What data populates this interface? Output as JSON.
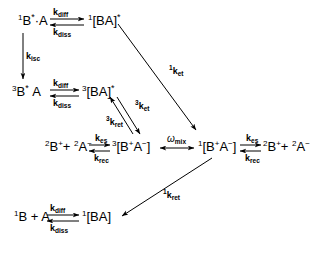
{
  "diagram": {
    "type": "reaction-scheme",
    "stroke_color": "#000000",
    "background_color": "#ffffff",
    "species": [
      {
        "id": "s1-excited-singlet-pair",
        "html": "<sup>1</sup>B<span class=\"ast\">*</span>&middot;A",
        "x": 18,
        "y": 14
      },
      {
        "id": "s1-singlet-exciplex",
        "html": "<sup>1</sup>[BA]<span class=\"ast\">*</span>",
        "x": 88,
        "y": 14
      },
      {
        "id": "t1-excited-triplet-pair",
        "html": "<sup>3</sup>B<span class=\"ast\">*</span>&nbsp;A",
        "x": 12,
        "y": 85
      },
      {
        "id": "t1-triplet-exciplex",
        "html": "<sup>3</sup>[BA]<span class=\"ast\">*</span>",
        "x": 82,
        "y": 85
      },
      {
        "id": "free-radical-ions-left",
        "html": "<sup>2</sup>B<sup>+</sup>+ <sup>2</sup>A<sup>&minus;</sup>",
        "x": 45,
        "y": 140
      },
      {
        "id": "triplet-radical-ion-pair",
        "html": "<sup>3</sup>[B<sup>+</sup>A<sup>&minus;</sup>]",
        "x": 112,
        "y": 140
      },
      {
        "id": "singlet-radical-ion-pair",
        "html": "<sup>1</sup>[B<sup>+</sup>A<sup>&minus;</sup>]",
        "x": 198,
        "y": 140
      },
      {
        "id": "free-radical-ions-right",
        "html": "<sup>2</sup>B<sup>+</sup>+ <sup>2</sup>A<sup>&minus;</sup>",
        "x": 263,
        "y": 140
      },
      {
        "id": "ground-state-pair",
        "html": "<sup>1</sup>B + A",
        "x": 14,
        "y": 210
      },
      {
        "id": "ground-state-complex",
        "html": "<sup>1</sup>[BA]",
        "x": 82,
        "y": 210
      }
    ],
    "rate_labels": [
      {
        "id": "k-diff-row1",
        "html": "k<sub>diff</sub>",
        "x": 53,
        "y": 8
      },
      {
        "id": "k-diss-row1",
        "html": "k<sub>diss</sub>",
        "x": 53,
        "y": 28
      },
      {
        "id": "k-isc",
        "html": "k<sub>isc</sub>",
        "x": 26,
        "y": 52
      },
      {
        "id": "k-diff-row2",
        "html": "k<sub>diff</sub>",
        "x": 53,
        "y": 79
      },
      {
        "id": "k-diss-row2",
        "html": "k<sub>diss</sub>",
        "x": 53,
        "y": 99
      },
      {
        "id": "k-et-singlet",
        "html": "<sup>1</sup>k<sub>et</sub>",
        "x": 169,
        "y": 67
      },
      {
        "id": "k-et-triplet",
        "html": "<sup>3</sup>k<sub>et</sub>",
        "x": 135,
        "y": 102
      },
      {
        "id": "k-ret-triplet",
        "html": "<sup>3</sup>k<sub>ret</sub>",
        "x": 106,
        "y": 118
      },
      {
        "id": "k-es-left",
        "html": "k<sub>es</sub>",
        "x": 95,
        "y": 134
      },
      {
        "id": "k-rec-left",
        "html": "k<sub>rec</sub>",
        "x": 94,
        "y": 154
      },
      {
        "id": "omega-mix",
        "html": "<span class=\"om\">&omega;</span><sub>mix</sub>",
        "x": 167,
        "y": 134
      },
      {
        "id": "k-es-right",
        "html": "k<sub>es</sub>",
        "x": 246,
        "y": 134
      },
      {
        "id": "k-rec-right",
        "html": "k<sub>rec</sub>",
        "x": 245,
        "y": 154
      },
      {
        "id": "k-ret-singlet",
        "html": "<sup>1</sup>k<sub>ret</sub>",
        "x": 163,
        "y": 191
      },
      {
        "id": "k-diff-row4",
        "html": "k<sub>diff</sub>",
        "x": 50,
        "y": 204
      },
      {
        "id": "k-diss-row4",
        "html": "k<sub>diss</sub>",
        "x": 50,
        "y": 224
      }
    ],
    "arrows": [
      {
        "id": "arrow-kdiff-row1",
        "kind": "forward",
        "x1": 50,
        "y1": 19,
        "x2": 84,
        "y2": 19
      },
      {
        "id": "arrow-kdiss-row1",
        "kind": "reverse",
        "x1": 84,
        "y1": 25,
        "x2": 50,
        "y2": 25
      },
      {
        "id": "arrow-kisc",
        "kind": "single",
        "x1": 23,
        "y1": 33,
        "x2": 23,
        "y2": 79
      },
      {
        "id": "arrow-kdiff-row2",
        "kind": "forward",
        "x1": 50,
        "y1": 90,
        "x2": 79,
        "y2": 90
      },
      {
        "id": "arrow-kdiss-row2",
        "kind": "reverse",
        "x1": 79,
        "y1": 96,
        "x2": 50,
        "y2": 96
      },
      {
        "id": "arrow-ket-singlet",
        "kind": "single",
        "x1": 118,
        "y1": 24,
        "x2": 196,
        "y2": 130
      },
      {
        "id": "arrow-ket-triplet",
        "kind": "single",
        "x1": 117,
        "y1": 97,
        "x2": 140,
        "y2": 134
      },
      {
        "id": "arrow-kret-triplet",
        "kind": "single",
        "x1": 133,
        "y1": 134,
        "x2": 110,
        "y2": 97
      },
      {
        "id": "arrow-kes-left",
        "kind": "forward",
        "x1": 89,
        "y1": 145,
        "x2": 110,
        "y2": 145
      },
      {
        "id": "arrow-krec-left",
        "kind": "reverse",
        "x1": 110,
        "y1": 151,
        "x2": 89,
        "y2": 151
      },
      {
        "id": "arrow-omega-mix",
        "kind": "double",
        "x1": 160,
        "y1": 148,
        "x2": 194,
        "y2": 148
      },
      {
        "id": "arrow-kes-right",
        "kind": "forward",
        "x1": 240,
        "y1": 145,
        "x2": 261,
        "y2": 145
      },
      {
        "id": "arrow-krec-right",
        "kind": "reverse",
        "x1": 261,
        "y1": 151,
        "x2": 240,
        "y2": 151
      },
      {
        "id": "arrow-kret-singlet",
        "kind": "single",
        "x1": 212,
        "y1": 158,
        "x2": 122,
        "y2": 216
      },
      {
        "id": "arrow-kdiff-row4",
        "kind": "forward",
        "x1": 47,
        "y1": 215,
        "x2": 79,
        "y2": 215
      },
      {
        "id": "arrow-kdiss-row4",
        "kind": "reverse",
        "x1": 79,
        "y1": 221,
        "x2": 47,
        "y2": 221
      }
    ]
  }
}
